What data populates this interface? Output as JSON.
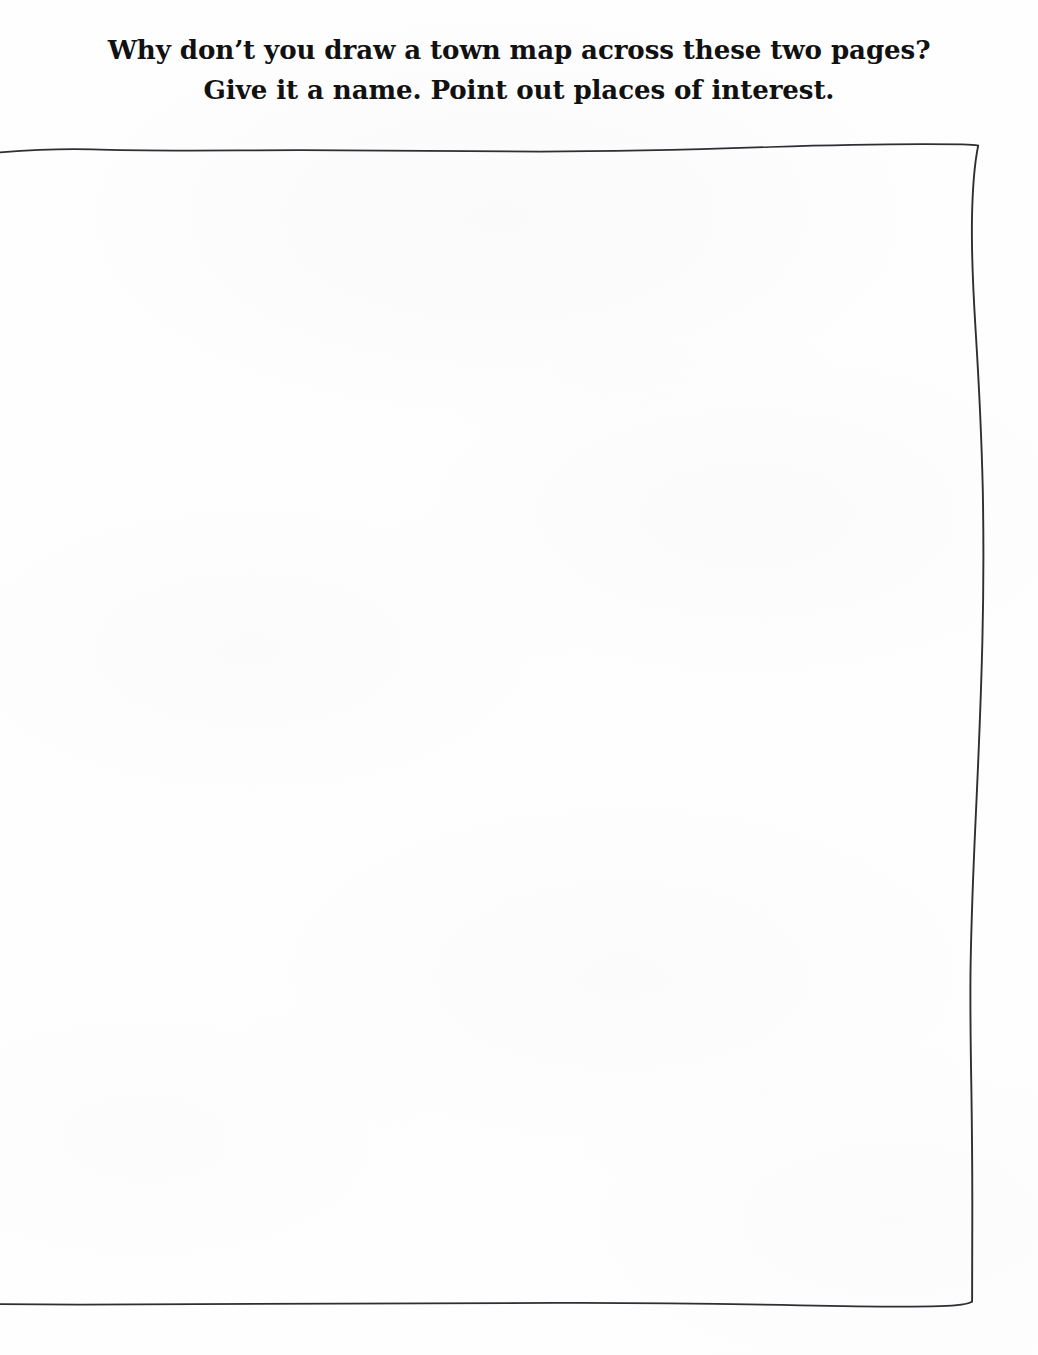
{
  "page": {
    "background_color": "#fefefe",
    "ink_color": "#111112",
    "rule_color": "#2b2b2f",
    "width": 1038,
    "height": 1355
  },
  "prompt": {
    "line_1": "Why don’t you draw a town map across these two pages?",
    "line_2": "Give it a name. Point out places of interest."
  },
  "drawing_area": {
    "label": "blank drawing area",
    "content": ""
  },
  "frame": {
    "label": "hand-drawn page border",
    "top_rule_name": "top-border-line",
    "right_rule_name": "right-border-line",
    "bottom_rule_name": "bottom-border-line"
  }
}
